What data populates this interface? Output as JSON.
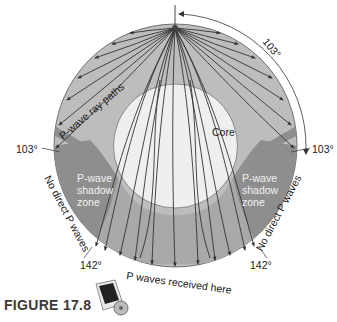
{
  "figure": {
    "caption": "FIGURE 17.8",
    "core_label": "Core",
    "ray_paths_label": "P-wave ray paths",
    "shadow_zone_left": [
      "P-wave",
      "shadow",
      "zone"
    ],
    "shadow_zone_right": [
      "P-wave",
      "shadow",
      "zone"
    ],
    "no_direct_left": "No direct P waves",
    "no_direct_right": "No direct P waves",
    "received_label": "P waves received here",
    "angle_top_arc": "103°",
    "angle_left": "103°",
    "angle_right": "103°",
    "angle_bottom_left": "142°",
    "angle_bottom_right": "142°",
    "media_icon": "cd-rom-media-icon"
  },
  "colors": {
    "mantle": "#bdbdbd",
    "shadow_zone": "#8e8e8e",
    "lower_band": "#a9a9a9",
    "core": "#efefef",
    "ray_line": "#333333",
    "caption": "#3a3a3a"
  }
}
